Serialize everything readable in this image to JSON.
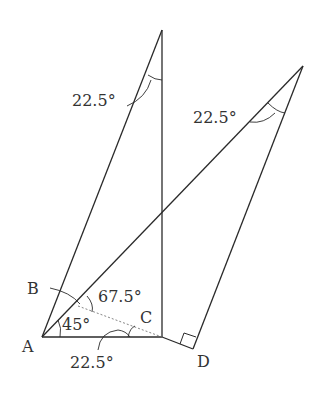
{
  "diagram": {
    "points": {
      "A": {
        "label": "A",
        "x": 42,
        "y": 337
      },
      "B": {
        "label": "B",
        "x": 78,
        "y": 306
      },
      "C": {
        "label": "C",
        "x": 162,
        "y": 337
      },
      "D": {
        "label": "D",
        "x": 193,
        "y": 349
      },
      "top_left": {
        "x": 162,
        "y": 30
      },
      "top_right": {
        "x": 303,
        "y": 66
      }
    },
    "angles": {
      "top_left": "22.5°",
      "top_right": "22.5°",
      "at_B": "67.5°",
      "at_A": "45°",
      "at_C_bottom": "22.5°"
    },
    "colors": {
      "line": "#2a2a2a",
      "dashed": "#777777",
      "text": "#333333",
      "background": "#ffffff"
    }
  }
}
